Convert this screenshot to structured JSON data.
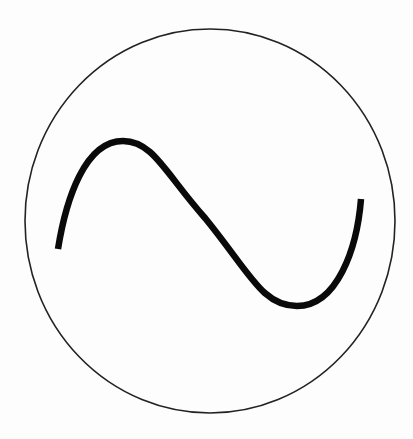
{
  "diagram": {
    "symbol": "ac-source-symbol",
    "circle": {
      "cx": 210,
      "cy": 221,
      "rx": 185,
      "ry": 192,
      "stroke": "#222222",
      "stroke_width": 1.6
    },
    "wave": {
      "type": "sine",
      "periods": 1,
      "start": [
        58,
        249
      ],
      "peak": [
        123,
        141
      ],
      "midpoint": [
        205,
        218
      ],
      "trough": [
        297,
        306
      ],
      "end": [
        361,
        199
      ],
      "stroke": "#0a0a0a",
      "stroke_width": 6.5
    },
    "background": "#fdfdfd"
  }
}
